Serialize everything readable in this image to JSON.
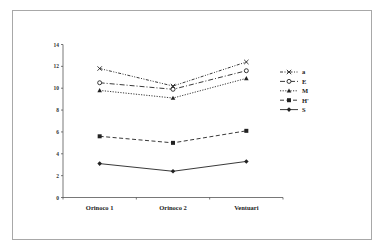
{
  "chart_data": {
    "type": "line",
    "title": "",
    "xlabel": "",
    "ylabel": "",
    "categories": [
      "Orinoco 1",
      "Orinoco 2",
      "Ventuari"
    ],
    "ylim": [
      0,
      14
    ],
    "yticks": [
      0,
      2,
      4,
      6,
      8,
      10,
      12,
      14
    ],
    "grid": false,
    "legend_position": "right",
    "series": [
      {
        "name": "a",
        "values": [
          11.8,
          10.2,
          12.4
        ],
        "marker": "x",
        "line_style": "dash-dot-dot"
      },
      {
        "name": "E",
        "values": [
          10.5,
          9.9,
          11.6
        ],
        "marker": "open-circle",
        "line_style": "long-dash-dot"
      },
      {
        "name": "M",
        "values": [
          9.8,
          9.1,
          10.9
        ],
        "marker": "triangle",
        "line_style": "dotted"
      },
      {
        "name": "H'",
        "values": [
          5.6,
          5.0,
          6.1
        ],
        "marker": "square",
        "line_style": "dashed"
      },
      {
        "name": "S",
        "values": [
          3.1,
          2.4,
          3.3
        ],
        "marker": "diamond",
        "line_style": "solid"
      }
    ]
  },
  "colors": {
    "line": "#222222",
    "axis": "#555555",
    "frame": "#a8a8a8"
  }
}
